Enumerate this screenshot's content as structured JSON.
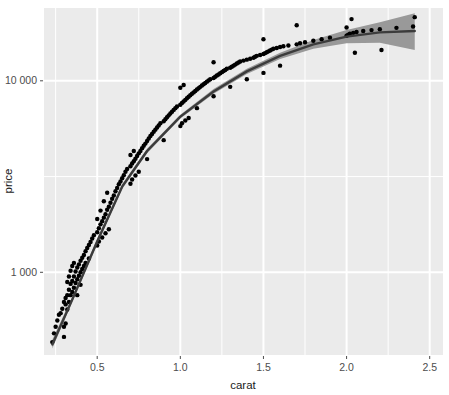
{
  "chart_data": {
    "type": "scatter",
    "title": "",
    "subtitle": "",
    "xlabel": "carat",
    "ylabel": "price",
    "x_scale": "linear",
    "y_scale": "log10",
    "xlim": [
      0.18,
      2.58
    ],
    "ylim": [
      370,
      24000
    ],
    "x_ticks": [
      0.5,
      1.0,
      1.5,
      2.0,
      2.5
    ],
    "x_tick_labels": [
      "0.5",
      "1.0",
      "1.5",
      "2.0",
      "2.5"
    ],
    "y_ticks": [
      1000,
      10000
    ],
    "y_tick_labels": [
      "1 000",
      "10 000"
    ],
    "x_minor_ticks": [
      0.25,
      0.75,
      1.25,
      1.75,
      2.25
    ],
    "y_minor_ticks": [
      3162,
      31623
    ],
    "grid": true,
    "grid_major_color": "#ffffff",
    "grid_minor_color": "#ffffff",
    "panel_background": "#ebebeb",
    "plot_background": "#ffffff",
    "legend_position": "none",
    "point_color": "#000000",
    "point_size": 3.0,
    "smooth_line_color": "#3c3c3c",
    "smooth_band_color": "#999999",
    "smooth_method": "loess",
    "series": [
      {
        "name": "diamonds",
        "points": [
          [
            0.23,
            432
          ],
          [
            0.24,
            480
          ],
          [
            0.25,
            520
          ],
          [
            0.26,
            560
          ],
          [
            0.27,
            600
          ],
          [
            0.28,
            612
          ],
          [
            0.29,
            645
          ],
          [
            0.3,
            700
          ],
          [
            0.3,
            520
          ],
          [
            0.3,
            460
          ],
          [
            0.31,
            680
          ],
          [
            0.31,
            735
          ],
          [
            0.31,
            540
          ],
          [
            0.32,
            760
          ],
          [
            0.32,
            640
          ],
          [
            0.32,
            890
          ],
          [
            0.33,
            810
          ],
          [
            0.33,
            700
          ],
          [
            0.33,
            950
          ],
          [
            0.34,
            870
          ],
          [
            0.34,
            760
          ],
          [
            0.34,
            1020
          ],
          [
            0.35,
            900
          ],
          [
            0.35,
            790
          ],
          [
            0.35,
            1080
          ],
          [
            0.36,
            950
          ],
          [
            0.36,
            830
          ],
          [
            0.36,
            1120
          ],
          [
            0.37,
            1010
          ],
          [
            0.37,
            880
          ],
          [
            0.38,
            1060
          ],
          [
            0.38,
            920
          ],
          [
            0.38,
            760
          ],
          [
            0.39,
            1100
          ],
          [
            0.39,
            960
          ],
          [
            0.4,
            1150
          ],
          [
            0.4,
            1000
          ],
          [
            0.4,
            860
          ],
          [
            0.41,
            1190
          ],
          [
            0.41,
            1040
          ],
          [
            0.42,
            1230
          ],
          [
            0.42,
            1080
          ],
          [
            0.43,
            1290
          ],
          [
            0.43,
            1120
          ],
          [
            0.44,
            1340
          ],
          [
            0.45,
            1390
          ],
          [
            0.45,
            1180
          ],
          [
            0.46,
            1440
          ],
          [
            0.47,
            1500
          ],
          [
            0.48,
            1560
          ],
          [
            0.5,
            1620
          ],
          [
            0.5,
            1380
          ],
          [
            0.5,
            1900
          ],
          [
            0.51,
            1700
          ],
          [
            0.51,
            1450
          ],
          [
            0.52,
            1780
          ],
          [
            0.52,
            2100
          ],
          [
            0.53,
            1850
          ],
          [
            0.53,
            1520
          ],
          [
            0.54,
            1930
          ],
          [
            0.54,
            2350
          ],
          [
            0.55,
            2010
          ],
          [
            0.55,
            1600
          ],
          [
            0.56,
            2120
          ],
          [
            0.56,
            2600
          ],
          [
            0.57,
            2200
          ],
          [
            0.57,
            1680
          ],
          [
            0.58,
            2310
          ],
          [
            0.59,
            2420
          ],
          [
            0.6,
            2520
          ],
          [
            0.61,
            2650
          ],
          [
            0.62,
            2760
          ],
          [
            0.63,
            2880
          ],
          [
            0.64,
            2980
          ],
          [
            0.65,
            3100
          ],
          [
            0.66,
            3210
          ],
          [
            0.67,
            3350
          ],
          [
            0.68,
            3460
          ],
          [
            0.7,
            3580
          ],
          [
            0.7,
            2900
          ],
          [
            0.7,
            4100
          ],
          [
            0.71,
            3700
          ],
          [
            0.71,
            3050
          ],
          [
            0.72,
            3800
          ],
          [
            0.72,
            4300
          ],
          [
            0.73,
            3920
          ],
          [
            0.73,
            3200
          ],
          [
            0.74,
            4050
          ],
          [
            0.75,
            4180
          ],
          [
            0.75,
            3350
          ],
          [
            0.76,
            4300
          ],
          [
            0.77,
            4450
          ],
          [
            0.78,
            4580
          ],
          [
            0.79,
            4700
          ],
          [
            0.8,
            4850
          ],
          [
            0.8,
            3900
          ],
          [
            0.81,
            5000
          ],
          [
            0.82,
            5150
          ],
          [
            0.83,
            5280
          ],
          [
            0.84,
            5420
          ],
          [
            0.85,
            5560
          ],
          [
            0.86,
            5700
          ],
          [
            0.87,
            5850
          ],
          [
            0.88,
            6000
          ],
          [
            0.9,
            6150
          ],
          [
            0.9,
            4900
          ],
          [
            0.91,
            6300
          ],
          [
            0.92,
            6450
          ],
          [
            0.93,
            6600
          ],
          [
            0.94,
            6750
          ],
          [
            0.95,
            6900
          ],
          [
            0.96,
            7050
          ],
          [
            0.97,
            7200
          ],
          [
            0.98,
            7350
          ],
          [
            1.0,
            7500
          ],
          [
            1.0,
            5800
          ],
          [
            1.0,
            9200
          ],
          [
            1.01,
            7650
          ],
          [
            1.01,
            6000
          ],
          [
            1.02,
            7800
          ],
          [
            1.02,
            9500
          ],
          [
            1.03,
            7950
          ],
          [
            1.03,
            6200
          ],
          [
            1.04,
            8100
          ],
          [
            1.05,
            8250
          ],
          [
            1.05,
            6400
          ],
          [
            1.06,
            8400
          ],
          [
            1.07,
            8550
          ],
          [
            1.08,
            8700
          ],
          [
            1.09,
            8850
          ],
          [
            1.1,
            9000
          ],
          [
            1.1,
            7200
          ],
          [
            1.11,
            9150
          ],
          [
            1.12,
            9300
          ],
          [
            1.13,
            9450
          ],
          [
            1.14,
            9600
          ],
          [
            1.15,
            9750
          ],
          [
            1.16,
            9900
          ],
          [
            1.17,
            10050
          ],
          [
            1.18,
            10200
          ],
          [
            1.2,
            10350
          ],
          [
            1.2,
            8300
          ],
          [
            1.2,
            12500
          ],
          [
            1.21,
            10500
          ],
          [
            1.22,
            10650
          ],
          [
            1.23,
            10800
          ],
          [
            1.24,
            10950
          ],
          [
            1.25,
            11100
          ],
          [
            1.26,
            11250
          ],
          [
            1.27,
            11400
          ],
          [
            1.28,
            11550
          ],
          [
            1.3,
            11700
          ],
          [
            1.3,
            9300
          ],
          [
            1.31,
            11850
          ],
          [
            1.32,
            12000
          ],
          [
            1.33,
            12150
          ],
          [
            1.34,
            12300
          ],
          [
            1.35,
            12450
          ],
          [
            1.36,
            12600
          ],
          [
            1.38,
            12750
          ],
          [
            1.4,
            12900
          ],
          [
            1.4,
            10200
          ],
          [
            1.42,
            13050
          ],
          [
            1.44,
            13200
          ],
          [
            1.45,
            13350
          ],
          [
            1.46,
            13500
          ],
          [
            1.48,
            13650
          ],
          [
            1.5,
            13800
          ],
          [
            1.5,
            11000
          ],
          [
            1.5,
            16500
          ],
          [
            1.51,
            13950
          ],
          [
            1.52,
            14100
          ],
          [
            1.53,
            14250
          ],
          [
            1.54,
            14400
          ],
          [
            1.55,
            14550
          ],
          [
            1.56,
            14700
          ],
          [
            1.58,
            14850
          ],
          [
            1.6,
            15000
          ],
          [
            1.6,
            12000
          ],
          [
            1.62,
            15150
          ],
          [
            1.65,
            15300
          ],
          [
            1.7,
            15500
          ],
          [
            1.7,
            19500
          ],
          [
            1.72,
            15700
          ],
          [
            1.75,
            15900
          ],
          [
            1.8,
            16200
          ],
          [
            1.85,
            16500
          ],
          [
            1.9,
            16800
          ],
          [
            2.0,
            17200
          ],
          [
            2.0,
            19000
          ],
          [
            2.01,
            17400
          ],
          [
            2.02,
            17600
          ],
          [
            2.03,
            21000
          ],
          [
            2.04,
            17800
          ],
          [
            2.05,
            14000
          ],
          [
            2.06,
            18000
          ],
          [
            2.1,
            18200
          ],
          [
            2.15,
            18400
          ],
          [
            2.2,
            18600
          ],
          [
            2.21,
            14500
          ],
          [
            2.3,
            18900
          ],
          [
            2.4,
            19200
          ],
          [
            2.41,
            21500
          ]
        ]
      }
    ],
    "smooth": {
      "name": "loess fit",
      "x": [
        0.23,
        0.35,
        0.5,
        0.65,
        0.8,
        1.0,
        1.2,
        1.4,
        1.6,
        1.8,
        2.0,
        2.2,
        2.41
      ],
      "y": [
        420,
        720,
        1450,
        2800,
        4300,
        6500,
        8800,
        11200,
        13500,
        15500,
        17000,
        17900,
        18200
      ],
      "lower": [
        400,
        700,
        1400,
        2720,
        4180,
        6350,
        8550,
        10850,
        13000,
        14700,
        15700,
        15800,
        14500
      ],
      "upper": [
        445,
        745,
        1500,
        2880,
        4420,
        6650,
        9050,
        11550,
        14000,
        16350,
        18400,
        20200,
        22500
      ]
    }
  },
  "axes": {
    "x_title": "carat",
    "y_title": "price",
    "x_tick_labels": [
      "0.5",
      "1.0",
      "1.5",
      "2.0",
      "2.5"
    ],
    "y_tick_labels": [
      "10 000",
      "1 000"
    ]
  },
  "colors": {
    "panel": "#ebebeb",
    "grid": "#ffffff",
    "point": "#000000",
    "line": "#3c3c3c",
    "band": "#999999",
    "text": "#4d4d4d",
    "title": "#1a1a1a"
  }
}
